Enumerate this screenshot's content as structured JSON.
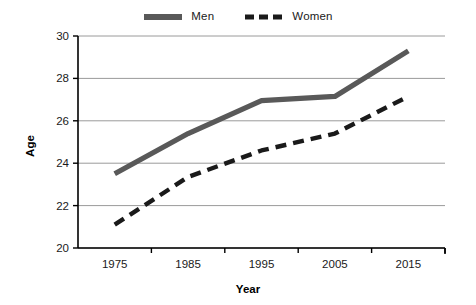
{
  "chart_data": {
    "type": "line",
    "title": "",
    "xlabel": "Year",
    "ylabel": "Age",
    "categories": [
      "1975",
      "1985",
      "1995",
      "2005",
      "2015"
    ],
    "x": [
      1975,
      1985,
      1995,
      2005,
      2015
    ],
    "series": [
      {
        "name": "Men",
        "values": [
          23.5,
          25.4,
          26.95,
          27.15,
          29.3
        ],
        "color": "#595959",
        "style": "solid"
      },
      {
        "name": "Women",
        "values": [
          21.1,
          23.35,
          24.6,
          25.4,
          27.15
        ],
        "color": "#1a1a1a",
        "style": "dashed"
      }
    ],
    "ylim": [
      20,
      30
    ],
    "yticks": [
      20,
      22,
      24,
      26,
      28,
      30
    ],
    "ytick_labels": [
      "20",
      "22",
      "24",
      "26",
      "28",
      "30"
    ],
    "xtick_labels": [
      "1975",
      "1985",
      "1995",
      "2005",
      "2015"
    ],
    "grid": "horizontal",
    "legend_position": "top-center",
    "background": "#ffffff",
    "gridline_color": "#9a9a9a",
    "axis_color": "#000000"
  },
  "legend": {
    "items": [
      {
        "label": "Men"
      },
      {
        "label": "Women"
      }
    ]
  },
  "axes": {
    "x_title": "Year",
    "y_title": "Age"
  }
}
